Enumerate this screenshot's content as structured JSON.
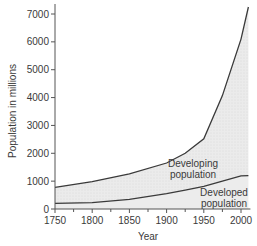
{
  "chart_data": {
    "type": "area",
    "title": "",
    "xlabel": "Year",
    "ylabel": "Population in millions",
    "xlim": [
      1750,
      2010
    ],
    "ylim": [
      0,
      7300
    ],
    "x_ticks": [
      1750,
      1800,
      1850,
      1900,
      1950,
      2000
    ],
    "x_minor_ticks": [
      1775,
      1825,
      1875,
      1925,
      1975
    ],
    "y_ticks": [
      0,
      1000,
      2000,
      3000,
      4000,
      5000,
      6000,
      7000
    ],
    "grid": false,
    "legend": "none (inline labels)",
    "x": [
      1750,
      1800,
      1850,
      1900,
      1925,
      1950,
      1975,
      2000,
      2010
    ],
    "series": [
      {
        "name": "Total world population (upper line)",
        "values": [
          780,
          980,
          1260,
          1650,
          2000,
          2520,
          4070,
          6100,
          7250
        ]
      },
      {
        "name": "Developed population",
        "values": [
          200,
          230,
          350,
          550,
          680,
          810,
          1000,
          1190,
          1200
        ]
      }
    ],
    "annotations": [
      {
        "text_line1": "Developing",
        "text_line2": "population",
        "region": "between developed line and total line"
      },
      {
        "text_line1": "Developed",
        "text_line2": "population",
        "region": "below developed line"
      }
    ],
    "colors": {
      "line": "#3a3a3a",
      "developing_fill": "#e6e6e6",
      "axis": "#555555",
      "text": "#3a3a3a"
    }
  }
}
